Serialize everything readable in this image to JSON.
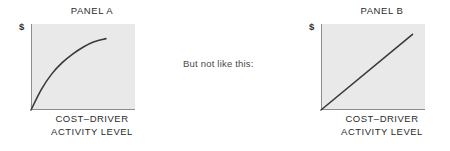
{
  "figure": {
    "background_color": "#ffffff",
    "plot_fill_color": "#e9e9e9",
    "axis_color": "#8d8d8d",
    "line_color": "#3a3a3a",
    "text_color": "#2b2b2b",
    "middle_note": "But not like this:"
  },
  "panel_a": {
    "title": "PANEL A",
    "y_axis_label": "$",
    "x_axis_caption_line1": "COST–DRIVER",
    "x_axis_caption_line2": "ACTIVITY LEVEL"
  },
  "panel_b": {
    "title": "PANEL B",
    "y_axis_label": "$",
    "x_axis_caption_line1": "COST–DRIVER",
    "x_axis_caption_line2": "ACTIVITY LEVEL"
  },
  "chart_data": [
    {
      "type": "line",
      "title": "PANEL A",
      "xlabel": "COST–DRIVER ACTIVITY LEVEL",
      "ylabel": "$",
      "grid": false,
      "legend": "none",
      "xlim": [
        0,
        100
      ],
      "ylim": [
        0,
        100
      ],
      "axis_ticks": [],
      "series": [
        {
          "name": "curvilinear cost",
          "shape": "concave-increasing",
          "x": [
            0,
            10,
            20,
            30,
            40,
            50,
            60,
            72
          ],
          "y": [
            0,
            24,
            42,
            55,
            65,
            73,
            79,
            83
          ]
        }
      ]
    },
    {
      "type": "line",
      "title": "PANEL B",
      "xlabel": "COST–DRIVER ACTIVITY LEVEL",
      "ylabel": "$",
      "grid": false,
      "legend": "none",
      "xlim": [
        0,
        100
      ],
      "ylim": [
        0,
        100
      ],
      "axis_ticks": [],
      "series": [
        {
          "name": "linear cost",
          "shape": "straight-increasing",
          "x": [
            0,
            88
          ],
          "y": [
            0,
            88
          ]
        }
      ]
    }
  ]
}
